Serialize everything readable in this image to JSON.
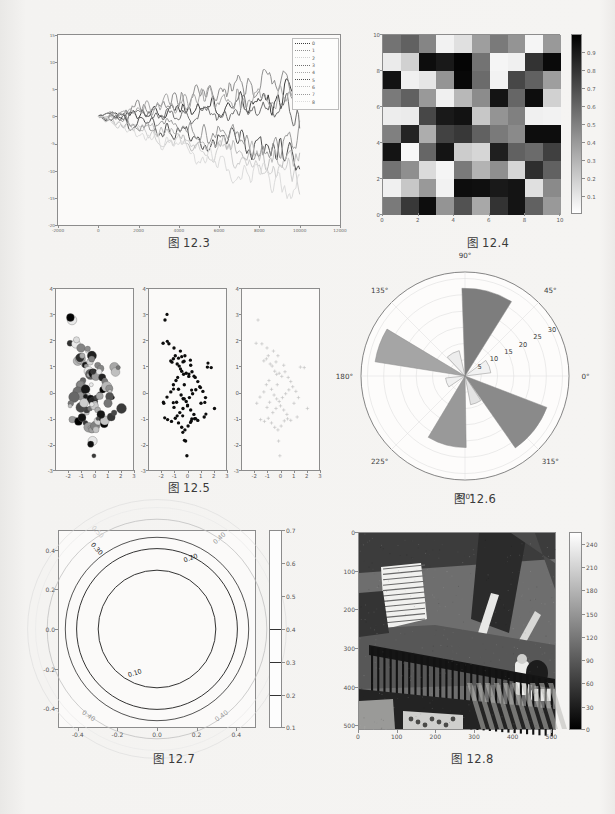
{
  "page": {
    "background": "#f3f2f0",
    "captions": [
      "图 12.3",
      "图 12.4",
      "图 12.5",
      "图 12.6",
      "图 12.7",
      "图 12.8"
    ]
  },
  "fig_12_3": {
    "caption": "图 12.3",
    "chart_data": {
      "type": "line",
      "title": "",
      "xlabel": "",
      "ylabel": "",
      "xlim": [
        -2000,
        12000
      ],
      "ylim": [
        -20,
        15
      ],
      "xticks": [
        "-2000",
        "0",
        "2000",
        "4000",
        "6000",
        "8000",
        "10000",
        "12000"
      ],
      "yticks": [
        "15",
        "10",
        "5",
        "0",
        "-5",
        "-10",
        "-15",
        "-20"
      ],
      "grid": false,
      "legend_position": "upper right",
      "legend": [
        "0",
        "1",
        "2",
        "3",
        "4",
        "5",
        "6",
        "7",
        "8"
      ],
      "series": [
        {
          "name": "0",
          "color": "#3d3d3d",
          "end_value": 3.0
        },
        {
          "name": "1",
          "color": "#8f8f8f",
          "end_value": 7.5
        },
        {
          "name": "2",
          "color": "#cfcfcf",
          "end_value": -11.0
        },
        {
          "name": "3",
          "color": "#6f6f6f",
          "end_value": 1.5
        },
        {
          "name": "4",
          "color": "#a8a8a8",
          "end_value": 5.0
        },
        {
          "name": "5",
          "color": "#4f4f4f",
          "end_value": -7.5
        },
        {
          "name": "6",
          "color": "#bdbdbd",
          "end_value": -9.0
        },
        {
          "name": "7",
          "color": "#9a9a9a",
          "end_value": -5.5
        },
        {
          "name": "8",
          "color": "#dcdcdc",
          "end_value": -13.5
        }
      ],
      "n_steps": 10000,
      "description": "nine random-walk traces starting at 0 and diverging between -15 and +8"
    }
  },
  "fig_12_4": {
    "caption": "图 12.4",
    "chart_data": {
      "type": "heatmap",
      "title": "",
      "xlim": [
        0,
        10
      ],
      "ylim": [
        0,
        10
      ],
      "xticks": [
        "0",
        "2",
        "4",
        "6",
        "8",
        "10"
      ],
      "yticks": [
        "0",
        "2",
        "4",
        "6",
        "8",
        "10"
      ],
      "colormap": "gray",
      "colorbar_ticks": [
        "0.9",
        "0.8",
        "0.7",
        "0.6",
        "0.5",
        "0.4",
        "0.3",
        "0.2",
        "0.1"
      ],
      "colorbar_range": [
        0.0,
        1.0
      ],
      "rows": 10,
      "cols": 10,
      "values": [
        [
          0.55,
          0.62,
          0.48,
          0.05,
          0.12,
          0.38,
          0.52,
          0.42,
          0.04,
          0.4
        ],
        [
          0.08,
          0.18,
          0.95,
          0.9,
          0.98,
          0.55,
          0.04,
          0.06,
          0.8,
          0.96
        ],
        [
          0.93,
          0.06,
          0.1,
          0.42,
          0.97,
          0.58,
          0.05,
          0.72,
          0.62,
          0.38
        ],
        [
          0.52,
          0.62,
          0.4,
          0.06,
          0.28,
          0.45,
          0.92,
          0.6,
          0.95,
          0.18
        ],
        [
          0.07,
          0.08,
          0.72,
          0.9,
          0.93,
          0.22,
          0.42,
          0.5,
          0.06,
          0.05
        ],
        [
          0.5,
          0.86,
          0.32,
          0.74,
          0.78,
          0.62,
          0.52,
          0.46,
          0.95,
          0.95
        ],
        [
          0.92,
          0.03,
          0.6,
          0.92,
          0.2,
          0.16,
          0.88,
          0.62,
          0.58,
          0.75
        ],
        [
          0.55,
          0.44,
          0.14,
          0.04,
          0.52,
          0.3,
          0.44,
          0.16,
          0.82,
          0.62
        ],
        [
          0.06,
          0.22,
          0.4,
          0.05,
          0.95,
          0.94,
          0.9,
          0.92,
          0.12,
          0.46
        ],
        [
          0.52,
          0.78,
          0.95,
          0.42,
          0.68,
          0.34,
          0.8,
          0.92,
          0.62,
          0.4
        ]
      ]
    }
  },
  "fig_12_5": {
    "caption": "图 12.5",
    "chart_data": {
      "type": "scatter",
      "title": "",
      "subplots": 3,
      "xlim": [
        -3,
        3
      ],
      "ylim": [
        -3,
        4
      ],
      "xticks": [
        "-2",
        "-1",
        "0",
        "1",
        "2",
        "3"
      ],
      "yticks": [
        "-3",
        "-2",
        "-1",
        "0",
        "1",
        "2",
        "3",
        "4"
      ],
      "panels": [
        {
          "name": "bubble-varying-size-and-gray",
          "marker": "circle",
          "n": 100
        },
        {
          "name": "uniform-black-dots",
          "marker": "circle",
          "n": 100
        },
        {
          "name": "light-gray-plus-markers",
          "marker": "plus",
          "n": 60
        }
      ],
      "points": [
        [
          -1.75,
          2.8
        ],
        [
          -1.9,
          1.9
        ],
        [
          -1.45,
          1.88
        ],
        [
          -1.05,
          1.72
        ],
        [
          -0.55,
          1.6
        ],
        [
          -1.3,
          1.22
        ],
        [
          -1.1,
          1.3
        ],
        [
          -0.95,
          1.42
        ],
        [
          -0.8,
          1.1
        ],
        [
          -0.65,
          1.02
        ],
        [
          1.55,
          0.98
        ],
        [
          1.85,
          0.96
        ],
        [
          0.25,
          1.05
        ],
        [
          -0.2,
          1.42
        ],
        [
          -0.35,
          1.18
        ],
        [
          -0.45,
          0.82
        ],
        [
          -0.3,
          0.7
        ],
        [
          -0.1,
          0.74
        ],
        [
          0.1,
          0.62
        ],
        [
          0.35,
          0.8
        ],
        [
          0.6,
          0.58
        ],
        [
          0.8,
          0.42
        ],
        [
          -0.9,
          0.46
        ],
        [
          -1.1,
          0.3
        ],
        [
          -1.3,
          0.02
        ],
        [
          -1.6,
          -0.18
        ],
        [
          -1.85,
          -0.42
        ],
        [
          -0.7,
          0.12
        ],
        [
          -0.5,
          -0.1
        ],
        [
          -0.3,
          -0.25
        ],
        [
          -0.1,
          -0.35
        ],
        [
          0.15,
          -0.2
        ],
        [
          0.4,
          -0.05
        ],
        [
          0.65,
          0.1
        ],
        [
          0.95,
          0.22
        ],
        [
          1.2,
          0.04
        ],
        [
          1.4,
          -0.2
        ],
        [
          2.1,
          -0.62
        ],
        [
          -1.55,
          -1.05
        ],
        [
          -1.25,
          -1.12
        ],
        [
          -0.95,
          -1.0
        ],
        [
          -0.7,
          -1.18
        ],
        [
          -0.45,
          -1.35
        ],
        [
          -0.2,
          -1.45
        ],
        [
          0.05,
          -1.3
        ],
        [
          0.3,
          -1.1
        ],
        [
          0.55,
          -1.02
        ],
        [
          0.8,
          -1.08
        ],
        [
          -0.15,
          -1.88
        ],
        [
          -0.05,
          -2.45
        ],
        [
          -0.6,
          -0.78
        ],
        [
          -0.35,
          -0.62
        ],
        [
          0.0,
          -0.52
        ],
        [
          0.25,
          -0.68
        ],
        [
          0.5,
          -0.85
        ],
        [
          -0.85,
          -0.38
        ],
        [
          -1.05,
          -0.58
        ],
        [
          1.05,
          -0.42
        ],
        [
          1.3,
          -0.95
        ],
        [
          -0.25,
          0.3
        ]
      ]
    }
  },
  "fig_12_6": {
    "caption": "图 12.6",
    "chart_data": {
      "type": "bar",
      "subtype": "polar-rose",
      "title": "",
      "angular_ticks": [
        "0°",
        "45°",
        "90°",
        "135°",
        "180°",
        "225°",
        "270°",
        "315°"
      ],
      "radial_ticks": [
        "5",
        "10",
        "15",
        "20",
        "25",
        "30"
      ],
      "rlim": [
        0,
        32
      ],
      "grid": true,
      "sectors": [
        {
          "theta_deg": 22,
          "width_deg": 30,
          "radius": 8,
          "color": "#f2f2f2"
        },
        {
          "theta_deg": 75,
          "width_deg": 34,
          "radius": 27,
          "color": "#7d7d7d"
        },
        {
          "theta_deg": 118,
          "width_deg": 30,
          "radius": 8,
          "color": "#ededed"
        },
        {
          "theta_deg": 160,
          "width_deg": 22,
          "radius": 28,
          "color": "#a5a5a5"
        },
        {
          "theta_deg": 200,
          "width_deg": 28,
          "radius": 6,
          "color": "#f0f0f0"
        },
        {
          "theta_deg": 255,
          "width_deg": 32,
          "radius": 22,
          "color": "#999999"
        },
        {
          "theta_deg": 292,
          "width_deg": 22,
          "radius": 9,
          "color": "#e3e3e3"
        },
        {
          "theta_deg": 322,
          "width_deg": 34,
          "radius": 27,
          "color": "#8a8a8a"
        }
      ]
    }
  },
  "fig_12_7": {
    "caption": "图 12.7",
    "chart_data": {
      "type": "line",
      "subtype": "contour",
      "title": "",
      "xlim": [
        -0.5,
        0.5
      ],
      "ylim": [
        -0.5,
        0.5
      ],
      "xticks": [
        "-0.4",
        "-0.2",
        "0.0",
        "0.2",
        "0.4"
      ],
      "yticks": [
        "-0.4",
        "-0.2",
        "0.0",
        "0.2",
        "0.4"
      ],
      "contour_levels": [
        0.1,
        0.2,
        0.3,
        0.4,
        0.5
      ],
      "contour_labels": [
        "0.10",
        "0.20",
        "0.30",
        "0.40",
        "0.50"
      ],
      "colorbar_ticks": [
        "0.1",
        "0.2",
        "0.3",
        "0.4",
        "0.5",
        "0.6",
        "0.7"
      ],
      "colorbar_range": [
        0.1,
        0.7
      ],
      "description": "concentric circular contours centered at origin, radii ~0.30 / 0.41 / 0.47 for 0.10 / 0.20 / 0.30"
    }
  },
  "fig_12_8": {
    "caption": "图 12.8",
    "chart_data": {
      "type": "heatmap",
      "subtype": "image",
      "title": "",
      "xlim": [
        0,
        512
      ],
      "ylim": [
        512,
        0
      ],
      "xticks": [
        "0",
        "100",
        "200",
        "300",
        "400",
        "500"
      ],
      "yticks": [
        "0",
        "100",
        "200",
        "300",
        "400",
        "500"
      ],
      "colormap": "gray",
      "colorbar_ticks": [
        "0",
        "30",
        "60",
        "90",
        "120",
        "150",
        "180",
        "210",
        "240"
      ],
      "colorbar_range": [
        0,
        255
      ],
      "description": "grayscale photograph of an exterior wooden staircase with railing and a person standing at upper right"
    }
  }
}
